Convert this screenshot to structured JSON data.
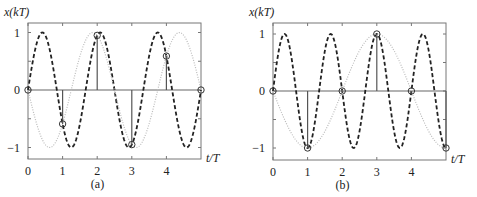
{
  "chart_data": [
    {
      "type": "line",
      "panel_label": "(a)",
      "ylabel": "x(kT)",
      "xlabel": "t/T",
      "xlim": [
        0,
        5
      ],
      "ylim": [
        -1.2,
        1.2
      ],
      "xticks": [
        0,
        1,
        2,
        3,
        4
      ],
      "xtick_labels": [
        "0",
        "1",
        "2",
        "3",
        "4"
      ],
      "yticks": [
        -1,
        0,
        1
      ],
      "ytick_labels": [
        "−1",
        "0",
        "1"
      ],
      "grid": false,
      "series": [
        {
          "name": "continuous signal",
          "style": "dashed",
          "color": "#222222",
          "function": "sin(2*pi*0.6*t)",
          "frequency": 0.6,
          "sign": 1
        },
        {
          "name": "aliased signal",
          "style": "dotted",
          "color": "#bbbbbb",
          "function": "-sin(2*pi*0.4*t)",
          "frequency": 0.4,
          "sign": -1
        },
        {
          "name": "samples",
          "style": "stem",
          "color": "#555555",
          "x": [
            0,
            1,
            2,
            3,
            4,
            5
          ],
          "y": [
            0,
            -0.59,
            0.95,
            -0.95,
            0.59,
            0
          ]
        }
      ]
    },
    {
      "type": "line",
      "panel_label": "(b)",
      "ylabel": "x(kT)",
      "xlabel": "t/T",
      "xlim": [
        0,
        5
      ],
      "ylim": [
        -1.2,
        1.2
      ],
      "xticks": [
        0,
        1,
        2,
        3,
        4
      ],
      "xtick_labels": [
        "0",
        "1",
        "2",
        "3",
        "4"
      ],
      "yticks": [
        -1,
        0,
        1
      ],
      "ytick_labels": [
        "−1",
        "0",
        "1"
      ],
      "grid": false,
      "series": [
        {
          "name": "continuous signal",
          "style": "dashed",
          "color": "#222222",
          "function": "sin(2*pi*0.75*t)",
          "frequency": 0.75,
          "sign": 1
        },
        {
          "name": "aliased signal",
          "style": "dotted",
          "color": "#bbbbbb",
          "function": "-sin(2*pi*0.25*t)",
          "frequency": 0.25,
          "sign": -1
        },
        {
          "name": "samples",
          "style": "stem",
          "color": "#555555",
          "x": [
            0,
            1,
            2,
            3,
            4,
            5
          ],
          "y": [
            0,
            -1,
            0,
            1,
            0,
            -1
          ]
        }
      ]
    }
  ],
  "layout": {
    "panels": [
      {
        "left": 28,
        "right": 201,
        "top": 23,
        "bottom": 159,
        "y_one": 33,
        "y_zero": 90,
        "y_minus_one": 148
      },
      {
        "left": 273,
        "right": 446,
        "top": 23,
        "bottom": 160,
        "y_one": 34,
        "y_zero": 91,
        "y_minus_one": 148
      }
    ]
  }
}
